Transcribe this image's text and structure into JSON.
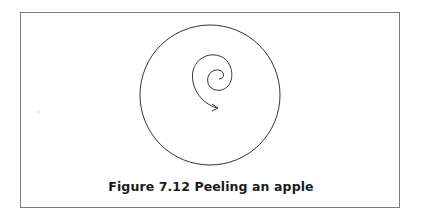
{
  "figure": {
    "caption": "Figure 7.12  Peeling an apple",
    "shapes": [
      {
        "type": "circle",
        "name": "apple-outline",
        "cx": 210,
        "cy": 95,
        "r": 70
      },
      {
        "type": "spiral-arrow",
        "name": "peel-spiral",
        "direction": "outward-clockwise",
        "end": "arrowhead"
      }
    ],
    "colors": {
      "stroke": "#333333",
      "frame": "#7a7a7a"
    }
  }
}
